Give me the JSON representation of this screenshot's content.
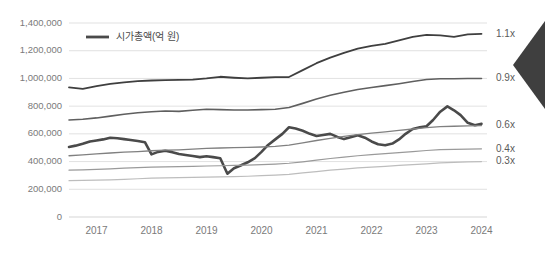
{
  "chart_data": {
    "type": "line",
    "title": "",
    "subtitle": "",
    "xlabel": "",
    "ylabel": "",
    "ylim": [
      0,
      1400000
    ],
    "ytick_values": [
      0,
      200000,
      400000,
      600000,
      800000,
      1000000,
      1200000,
      1400000
    ],
    "ytick_labels": [
      "0",
      "200,000",
      "400,000",
      "600,000",
      "800,000",
      "1,000,000",
      "1,200,000",
      "1,400,000"
    ],
    "categories": [
      "2017",
      "2018",
      "2019",
      "2020",
      "2021",
      "2022",
      "2023",
      "2024"
    ],
    "xtick_labels": [
      "2017",
      "2018",
      "2019",
      "2020",
      "2021",
      "2022",
      "2023",
      "2024"
    ],
    "x_start": 2017.0,
    "x_end": 2024.6,
    "grid": true,
    "legend_position": "top-left",
    "legend": [
      {
        "name": "시가총액(억 원)",
        "color": "#4a4a4a"
      }
    ],
    "right_axis_labels": [
      {
        "text": "1.1x",
        "value": 1320000,
        "color": "#5a5a5a"
      },
      {
        "text": "0.9x",
        "value": 1000000,
        "color": "#5a5a5a"
      },
      {
        "text": "0.6x",
        "value": 660000,
        "color": "#5a5a5a"
      },
      {
        "text": "0.4x",
        "value": 490000,
        "color": "#5a5a5a"
      },
      {
        "text": "0.3x",
        "value": 400000,
        "color": "#5a5a5a"
      }
    ],
    "annotations": [
      {
        "name": "left-pointing-arrow",
        "shape": "chevron-left",
        "color": "#3f3f3f"
      }
    ],
    "series": [
      {
        "name": "시가총액(억 원)",
        "color": "#4a4a4a",
        "width": 2.6,
        "emphasis": true,
        "x": [
          2017.0,
          2017.12,
          2017.25,
          2017.38,
          2017.5,
          2017.62,
          2017.75,
          2017.88,
          2018.0,
          2018.12,
          2018.25,
          2018.38,
          2018.5,
          2018.62,
          2018.75,
          2018.88,
          2019.0,
          2019.12,
          2019.25,
          2019.38,
          2019.5,
          2019.62,
          2019.75,
          2019.88,
          2020.0,
          2020.12,
          2020.25,
          2020.38,
          2020.5,
          2020.62,
          2020.75,
          2020.88,
          2021.0,
          2021.12,
          2021.25,
          2021.38,
          2021.5,
          2021.62,
          2021.75,
          2021.88,
          2022.0,
          2022.12,
          2022.25,
          2022.38,
          2022.5,
          2022.62,
          2022.75,
          2022.88,
          2023.0,
          2023.12,
          2023.25,
          2023.38,
          2023.5,
          2023.62,
          2023.75,
          2023.88,
          2024.0,
          2024.12,
          2024.25,
          2024.38,
          2024.5
        ],
        "y": [
          505000,
          515000,
          528000,
          545000,
          552000,
          560000,
          572000,
          568000,
          562000,
          556000,
          548000,
          540000,
          452000,
          470000,
          478000,
          468000,
          455000,
          448000,
          440000,
          432000,
          438000,
          432000,
          424000,
          312000,
          352000,
          372000,
          395000,
          425000,
          470000,
          520000,
          560000,
          600000,
          648000,
          638000,
          622000,
          600000,
          585000,
          592000,
          600000,
          578000,
          562000,
          575000,
          590000,
          572000,
          545000,
          525000,
          518000,
          530000,
          560000,
          600000,
          635000,
          648000,
          655000,
          700000,
          760000,
          798000,
          770000,
          735000,
          680000,
          662000,
          672000
        ]
      },
      {
        "name": "1.1x band",
        "color": "#3f3f3f",
        "width": 1.8,
        "emphasis": false,
        "x": [
          2017.0,
          2017.25,
          2017.5,
          2017.75,
          2018.0,
          2018.25,
          2018.5,
          2018.75,
          2019.0,
          2019.25,
          2019.5,
          2019.75,
          2020.0,
          2020.25,
          2020.5,
          2020.75,
          2021.0,
          2021.25,
          2021.5,
          2021.75,
          2022.0,
          2022.25,
          2022.5,
          2022.75,
          2023.0,
          2023.25,
          2023.5,
          2023.75,
          2024.0,
          2024.25,
          2024.5
        ],
        "y": [
          935000,
          925000,
          945000,
          960000,
          972000,
          980000,
          985000,
          988000,
          990000,
          992000,
          1000000,
          1012000,
          1005000,
          1000000,
          1005000,
          1010000,
          1010000,
          1060000,
          1110000,
          1150000,
          1185000,
          1215000,
          1235000,
          1250000,
          1275000,
          1300000,
          1315000,
          1310000,
          1300000,
          1318000,
          1322000
        ]
      },
      {
        "name": "0.9x band",
        "color": "#5f5f5f",
        "width": 1.6,
        "emphasis": false,
        "x": [
          2017.0,
          2017.25,
          2017.5,
          2017.75,
          2018.0,
          2018.25,
          2018.5,
          2018.75,
          2019.0,
          2019.25,
          2019.5,
          2019.75,
          2020.0,
          2020.25,
          2020.5,
          2020.75,
          2021.0,
          2021.25,
          2021.5,
          2021.75,
          2022.0,
          2022.25,
          2022.5,
          2022.75,
          2023.0,
          2023.25,
          2023.5,
          2023.75,
          2024.0,
          2024.25,
          2024.5
        ],
        "y": [
          700000,
          705000,
          715000,
          728000,
          742000,
          752000,
          760000,
          765000,
          762000,
          770000,
          778000,
          775000,
          772000,
          772000,
          775000,
          778000,
          790000,
          820000,
          852000,
          878000,
          900000,
          920000,
          935000,
          948000,
          962000,
          978000,
          992000,
          998000,
          998000,
          1000000,
          1000000
        ]
      },
      {
        "name": "0.6x band",
        "color": "#808080",
        "width": 1.3,
        "emphasis": false,
        "x": [
          2017.0,
          2017.25,
          2017.5,
          2017.75,
          2018.0,
          2018.25,
          2018.5,
          2018.75,
          2019.0,
          2019.25,
          2019.5,
          2019.75,
          2020.0,
          2020.25,
          2020.5,
          2020.75,
          2021.0,
          2021.25,
          2021.5,
          2021.75,
          2022.0,
          2022.25,
          2022.5,
          2022.75,
          2023.0,
          2023.25,
          2023.5,
          2023.75,
          2024.0,
          2024.25,
          2024.5
        ],
        "y": [
          442000,
          448000,
          455000,
          462000,
          468000,
          472000,
          478000,
          482000,
          485000,
          490000,
          495000,
          498000,
          500000,
          502000,
          505000,
          510000,
          518000,
          535000,
          552000,
          568000,
          582000,
          595000,
          605000,
          615000,
          625000,
          635000,
          645000,
          652000,
          655000,
          658000,
          660000
        ]
      },
      {
        "name": "0.4x band",
        "color": "#9a9a9a",
        "width": 1.2,
        "emphasis": false,
        "x": [
          2017.0,
          2017.25,
          2017.5,
          2017.75,
          2018.0,
          2018.25,
          2018.5,
          2018.75,
          2019.0,
          2019.25,
          2019.5,
          2019.75,
          2020.0,
          2020.25,
          2020.5,
          2020.75,
          2021.0,
          2021.25,
          2021.5,
          2021.75,
          2022.0,
          2022.25,
          2022.5,
          2022.75,
          2023.0,
          2023.25,
          2023.5,
          2023.75,
          2024.0,
          2024.25,
          2024.5
        ],
        "y": [
          338000,
          340000,
          344000,
          348000,
          352000,
          356000,
          360000,
          362000,
          364000,
          366000,
          368000,
          370000,
          372000,
          374000,
          378000,
          382000,
          388000,
          398000,
          410000,
          422000,
          432000,
          442000,
          450000,
          458000,
          465000,
          472000,
          480000,
          486000,
          488000,
          490000,
          492000
        ]
      },
      {
        "name": "0.3x band",
        "color": "#bdbdbd",
        "width": 1.2,
        "emphasis": false,
        "x": [
          2017.0,
          2017.25,
          2017.5,
          2017.75,
          2018.0,
          2018.25,
          2018.5,
          2018.75,
          2019.0,
          2019.25,
          2019.5,
          2019.75,
          2020.0,
          2020.25,
          2020.5,
          2020.75,
          2021.0,
          2021.25,
          2021.5,
          2021.75,
          2022.0,
          2022.25,
          2022.5,
          2022.75,
          2023.0,
          2023.25,
          2023.5,
          2023.75,
          2024.0,
          2024.25,
          2024.5
        ],
        "y": [
          262000,
          264000,
          266000,
          268000,
          272000,
          276000,
          280000,
          282000,
          284000,
          286000,
          288000,
          290000,
          292000,
          294000,
          298000,
          302000,
          308000,
          318000,
          328000,
          338000,
          346000,
          354000,
          360000,
          366000,
          372000,
          378000,
          384000,
          390000,
          394000,
          398000,
          400000
        ]
      }
    ]
  }
}
